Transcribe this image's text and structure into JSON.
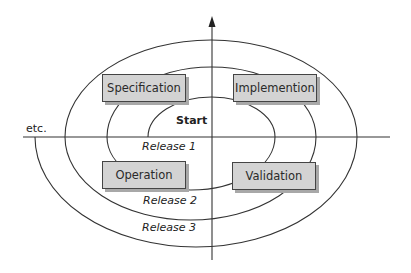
{
  "diagram": {
    "type": "spiral-model",
    "phases": [
      {
        "id": "specification",
        "label": "Specification"
      },
      {
        "id": "implementation",
        "label": "Implemention"
      },
      {
        "id": "operation",
        "label": "Operation"
      },
      {
        "id": "validation",
        "label": "Validation"
      }
    ],
    "start_label": "Start",
    "releases": [
      "Release 1",
      "Release 2",
      "Release 3"
    ],
    "continuation_label": "etc.",
    "colors": {
      "line": "#333333",
      "box_fill": "#d3d3d3",
      "box_shadow": "#a8a8a8",
      "background": "#ffffff"
    }
  }
}
